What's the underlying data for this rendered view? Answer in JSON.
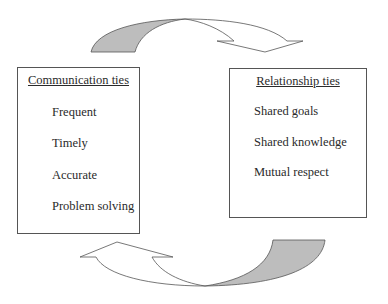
{
  "diagram": {
    "left_box": {
      "title": "Communication ties",
      "items": [
        "Frequent",
        "Timely",
        "Accurate",
        "Problem solving"
      ]
    },
    "right_box": {
      "title": "Relationship ties",
      "items": [
        "Shared goals",
        "Shared knowledge",
        "Mutual respect"
      ]
    },
    "arrows": {
      "top": {
        "from": "Communication ties",
        "to": "Relationship ties",
        "tail_color": "#bdbdbd"
      },
      "bottom": {
        "from": "Relationship ties",
        "to": "Communication ties",
        "tail_color": "#bdbdbd"
      }
    }
  }
}
